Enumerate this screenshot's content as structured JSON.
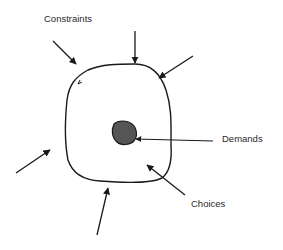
{
  "diagram": {
    "title": "",
    "labels": {
      "constraints": "Constraints",
      "demands": "Demands",
      "choices": "Choices"
    },
    "colors": {
      "stroke": "#1a1a1a",
      "core_fill": "#555555",
      "text": "#2a2a2a",
      "background": "#ffffff"
    },
    "elements": {
      "boundary": "Irregular closed loop representing the job/role area of choices",
      "core": "Dark filled blob at center representing demands",
      "constraint_arrows": 5,
      "demand_arrow": 1,
      "choice_arrow": 1
    }
  }
}
